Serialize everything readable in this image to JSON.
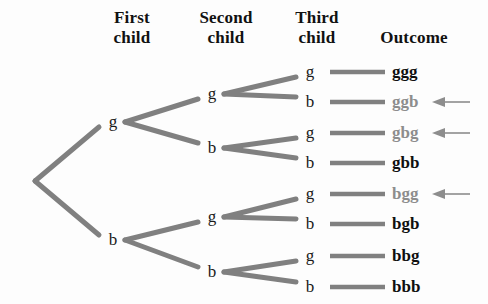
{
  "figure": {
    "type": "probability-tree-diagram",
    "background_color": "#fdfdfd",
    "branch_color": "#808080",
    "highlight_color": "#8d8d8d",
    "text_color": "#101010"
  },
  "headers": [
    {
      "id": "first-child",
      "label": "First\nchild",
      "x": 100,
      "y": 8,
      "width": 64
    },
    {
      "id": "second-child",
      "label": "Second\nchild",
      "x": 186,
      "y": 8,
      "width": 80
    },
    {
      "id": "third-child",
      "label": "Third\nchild",
      "x": 284,
      "y": 8,
      "width": 66
    },
    {
      "id": "outcome",
      "label": "Outcome",
      "x": 362,
      "y": 28,
      "width": 104
    }
  ],
  "nodes": {
    "root": {
      "label": "",
      "x": 35,
      "y": 181
    },
    "level1": [
      {
        "label": "g",
        "x": 113,
        "y": 122
      },
      {
        "label": "b",
        "x": 113,
        "y": 240
      }
    ],
    "level2": [
      {
        "label": "g",
        "x": 212,
        "y": 94
      },
      {
        "label": "b",
        "x": 212,
        "y": 148
      },
      {
        "label": "g",
        "x": 212,
        "y": 217
      },
      {
        "label": "b",
        "x": 212,
        "y": 272
      }
    ],
    "level3": [
      {
        "label": "g",
        "x": 310,
        "y": 72
      },
      {
        "label": "b",
        "x": 310,
        "y": 102
      },
      {
        "label": "g",
        "x": 310,
        "y": 133
      },
      {
        "label": "b",
        "x": 310,
        "y": 163
      },
      {
        "label": "g",
        "x": 310,
        "y": 194
      },
      {
        "label": "b",
        "x": 310,
        "y": 224
      },
      {
        "label": "g",
        "x": 310,
        "y": 256
      },
      {
        "label": "b",
        "x": 310,
        "y": 287
      }
    ]
  },
  "outcomes": [
    {
      "label": "ggg",
      "y": 72,
      "highlighted": false,
      "arrow": false
    },
    {
      "label": "ggb",
      "y": 102,
      "highlighted": true,
      "arrow": true
    },
    {
      "label": "gbg",
      "y": 133,
      "highlighted": true,
      "arrow": true
    },
    {
      "label": "gbb",
      "y": 163,
      "highlighted": false,
      "arrow": false
    },
    {
      "label": "bgg",
      "y": 194,
      "highlighted": true,
      "arrow": true
    },
    {
      "label": "bgb",
      "y": 224,
      "highlighted": false,
      "arrow": false
    },
    {
      "label": "bbg",
      "y": 256,
      "highlighted": false,
      "arrow": false
    },
    {
      "label": "bbb",
      "y": 287,
      "highlighted": false,
      "arrow": false
    }
  ]
}
